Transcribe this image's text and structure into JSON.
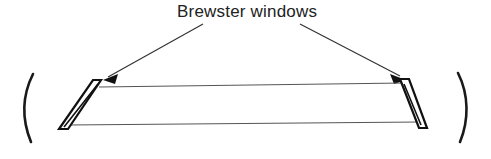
{
  "figure": {
    "title": "Brewster windows",
    "type": "optical-schematic",
    "background_color": "#ffffff",
    "ink_color": "#111111",
    "beam_color": "#555555"
  },
  "label": {
    "text": "Brewster windows",
    "x": 177,
    "y": 17
  },
  "leaders": [
    {
      "name": "leader-left",
      "from_x": 203,
      "from_y": 24,
      "to_x": 105,
      "to_y": 79,
      "arrow_direction": "down-left"
    },
    {
      "name": "leader-right",
      "from_x": 300,
      "from_y": 24,
      "to_x": 404,
      "to_y": 78,
      "arrow_direction": "down-right"
    }
  ],
  "mirrors": [
    {
      "name": "mirror-left",
      "glyph": "(",
      "path": "M 33 74 C 22 96, 22 120, 31 142",
      "side": "left"
    },
    {
      "name": "mirror-right",
      "glyph": ")",
      "path": "M 458 73 C 469 95, 469 120, 460 142",
      "side": "right"
    }
  ],
  "windows": [
    {
      "name": "brewster-window-left",
      "outline": "M 101 80 L 93 80 L 59 129 L 68 129 Z",
      "inner": "M 98 84 L 64 127",
      "tilt": "top-right",
      "side": "left"
    },
    {
      "name": "brewster-window-right",
      "outline": "M 400 79 L 409 79 L 427 128 L 419 128 Z",
      "inner": "M 404 84 L 421 125",
      "tilt": "top-right",
      "side": "right"
    }
  ],
  "beams": [
    {
      "name": "beam-upper",
      "path": "M 99 87 L 404 83",
      "position": "upper"
    },
    {
      "name": "beam-lower",
      "path": "M 68 125 L 420 122",
      "position": "lower"
    }
  ]
}
